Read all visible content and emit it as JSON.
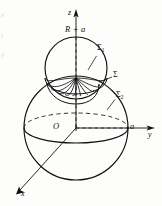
{
  "figure": {
    "type": "math-diagram-3d",
    "background_color": "#fdfdfc",
    "line_color": "#111111"
  },
  "axes": {
    "z": {
      "label": "z",
      "direction": "up"
    },
    "y": {
      "label": "y",
      "direction": "right"
    },
    "x": {
      "label": "x",
      "direction": "down-left"
    }
  },
  "points": {
    "origin": "O",
    "y_intercept": "a",
    "z_top": "R + a"
  },
  "surfaces": [
    {
      "name": "sigma-1",
      "symbol": "Σ",
      "subscript": "1",
      "target": "upper-small-sphere"
    },
    {
      "name": "sigma",
      "symbol": "Σ",
      "subscript": "",
      "target": "dome-cap-surface"
    },
    {
      "name": "sigma-2",
      "symbol": "Σ",
      "subscript": "2",
      "target": "lower-large-sphere"
    }
  ],
  "margin_fragments": [
    "s",
    "t",
    "ƒ"
  ]
}
